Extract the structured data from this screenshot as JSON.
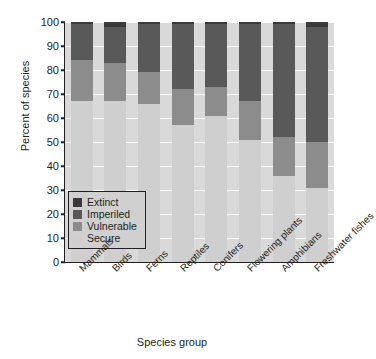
{
  "chart_data": {
    "type": "bar",
    "stacked": true,
    "title": "",
    "xlabel": "Species group",
    "ylabel": "Percent of species",
    "ylim": [
      0,
      100
    ],
    "yticks": [
      0,
      10,
      20,
      30,
      40,
      50,
      60,
      70,
      80,
      90,
      100
    ],
    "grid": true,
    "legend_position": "lower-left-inside",
    "categories": [
      "Mammals",
      "Birds",
      "Ferns",
      "Reptiles",
      "Conifers",
      "Flowering plants",
      "Amphibians",
      "Freshwater fishes"
    ],
    "series": [
      {
        "name": "Extinct",
        "color": "#3a3a3a",
        "values": [
          1,
          2,
          1,
          1,
          1,
          1,
          1,
          2
        ]
      },
      {
        "name": "Imperiled",
        "color": "#595959",
        "values": [
          15,
          15,
          20,
          27,
          26,
          32,
          47,
          48
        ]
      },
      {
        "name": "Vulnerable",
        "color": "#8c8c8c",
        "values": [
          17,
          16,
          13,
          15,
          12,
          16,
          16,
          19
        ]
      },
      {
        "name": "Secure",
        "color": "#cfcfcf",
        "values": [
          67,
          67,
          66,
          57,
          61,
          51,
          36,
          31
        ]
      }
    ],
    "legend_entries": [
      "Extinct",
      "Imperiled",
      "Vulnerable",
      "Secure"
    ]
  }
}
